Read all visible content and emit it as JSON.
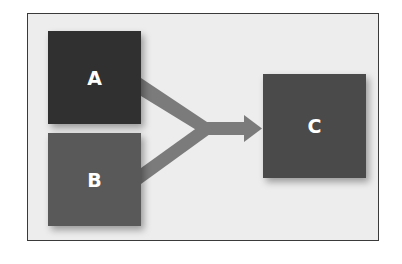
{
  "diagram": {
    "type": "merge-flow",
    "frame": {
      "background": "#ededed",
      "border": "#3a3a3a"
    },
    "nodes": [
      {
        "id": "A",
        "label": "A",
        "color": "#303030",
        "x": 48,
        "y": 31,
        "w": 93,
        "h": 93
      },
      {
        "id": "B",
        "label": "B",
        "color": "#595959",
        "x": 48,
        "y": 133,
        "w": 93,
        "h": 93
      },
      {
        "id": "C",
        "label": "C",
        "color": "#4a4a4a",
        "x": 263,
        "y": 74,
        "w": 103,
        "h": 104
      }
    ],
    "edges": [
      {
        "from": "A",
        "to": "C"
      },
      {
        "from": "B",
        "to": "C"
      }
    ],
    "arrow_color": "#7b7b7b"
  }
}
